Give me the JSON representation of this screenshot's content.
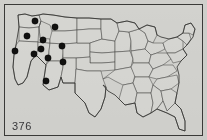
{
  "figure": {
    "caption": "376",
    "type": "dot-distribution-map",
    "region": "United States",
    "border_color": "#3a3a38",
    "background_color": "#cfcfcb",
    "map_fill_color": "#d6d6d2",
    "state_line_color": "#4a4a48",
    "dot_color": "#111110"
  },
  "map_data": {
    "type": "dot-distribution",
    "title": "",
    "projection_box": [
      0,
      0,
      197,
      130
    ],
    "dot_radius": 3.2,
    "dot_count": 11,
    "dots": [
      {
        "label": "dot-1",
        "region": "Washington",
        "x": 30,
        "y": 16
      },
      {
        "label": "dot-2",
        "region": "Montana",
        "x": 50,
        "y": 22
      },
      {
        "label": "dot-3",
        "region": "Oregon",
        "x": 22,
        "y": 31
      },
      {
        "label": "dot-4",
        "region": "Idaho",
        "x": 38,
        "y": 35
      },
      {
        "label": "dot-5",
        "region": "Wyoming",
        "x": 57,
        "y": 41
      },
      {
        "label": "dot-6",
        "region": "Northern California",
        "x": 10,
        "y": 46
      },
      {
        "label": "dot-7",
        "region": "Nevada",
        "x": 29,
        "y": 49
      },
      {
        "label": "dot-8",
        "region": "Utah",
        "x": 43,
        "y": 53
      },
      {
        "label": "dot-9",
        "region": "Western Colorado",
        "x": 58,
        "y": 57
      },
      {
        "label": "dot-10",
        "region": "Arizona",
        "x": 41,
        "y": 76
      },
      {
        "label": "dot-11",
        "region": "Southern Idaho",
        "x": 36,
        "y": 44
      }
    ],
    "regions_with_dots": [
      "Washington",
      "Oregon",
      "Idaho",
      "Montana",
      "Wyoming",
      "Nevada",
      "Utah",
      "Colorado",
      "California",
      "Arizona"
    ],
    "regions_without_dots": "All states east of the Rocky Mountains"
  }
}
